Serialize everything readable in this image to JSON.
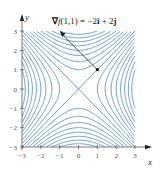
{
  "chart_data": {
    "type": "contour",
    "function": "f(x,y) = y^2 - x^2",
    "title": "",
    "annotation": {
      "text_parts": [
        {
          "t": "∇",
          "bold": true
        },
        {
          "t": "f",
          "italic": true
        },
        {
          "t": "(1,1) = −2"
        },
        {
          "t": "i",
          "bold": true
        },
        {
          "t": " + 2"
        },
        {
          "t": "j",
          "bold": true
        }
      ],
      "full_text": "∇f(1,1) = −2i + 2j",
      "point": [
        1,
        1
      ],
      "vector": [
        -2,
        2
      ]
    },
    "xlabel": "x",
    "ylabel": "y",
    "xlim": [
      -3,
      3
    ],
    "ylim": [
      -3,
      3
    ],
    "xticks": [
      -3,
      -2,
      -1,
      0,
      1,
      2,
      3
    ],
    "yticks": [
      -3,
      -2,
      -1,
      0,
      1,
      2,
      3
    ],
    "xtick_labels": [
      "−3",
      "−2",
      "−1",
      "0",
      "1",
      "2",
      "3"
    ],
    "ytick_labels": [
      "−3",
      "−2",
      "−1",
      "0",
      "1",
      "2",
      "3"
    ],
    "levels": [
      -9,
      -8,
      -7,
      -6,
      -5,
      -4,
      -3,
      -2,
      -1,
      0,
      1,
      2,
      3,
      4,
      5,
      6,
      7,
      8,
      9
    ],
    "grid": false,
    "legend": null,
    "colors": {
      "contour": "#5b92cf",
      "axis": "#555555",
      "arrow": "#222222"
    }
  }
}
